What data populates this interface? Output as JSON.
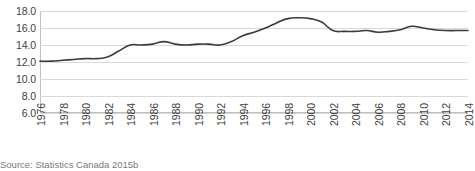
{
  "caption": "Source: Statistics Canada 2015b",
  "colors": {
    "series_line": "#3b3b3b",
    "gridline": "#d9d9d9",
    "axis": "#bfbfbf",
    "text": "#404040",
    "caption_text": "#7a7a7a",
    "background": "#ffffff"
  },
  "chart_data": {
    "type": "line",
    "title": "",
    "subtitle": "",
    "xlabel": "",
    "ylabel": "",
    "grid": true,
    "legend": false,
    "legend_position": "none",
    "xlim": [
      1976,
      2014
    ],
    "ylim": [
      6.0,
      18.0
    ],
    "ytick_labels": [
      "18.0",
      "16.0",
      "14.0",
      "12.0",
      "10.0",
      "8.0",
      "6.0"
    ],
    "yticks": [
      18.0,
      16.0,
      14.0,
      12.0,
      10.0,
      8.0,
      6.0
    ],
    "xtick_labels": [
      "1976",
      "1978",
      "1980",
      "1982",
      "1984",
      "1986",
      "1988",
      "1990",
      "1992",
      "1994",
      "1996",
      "1998",
      "2000",
      "2002",
      "2004",
      "2006",
      "2008",
      "2010",
      "2012",
      "2014"
    ],
    "xticks": [
      1976,
      1978,
      1980,
      1982,
      1984,
      1986,
      1988,
      1990,
      1992,
      1994,
      1996,
      1998,
      2000,
      2002,
      2004,
      2006,
      2008,
      2010,
      2012,
      2014
    ],
    "x": [
      1976,
      1977,
      1978,
      1979,
      1980,
      1981,
      1982,
      1983,
      1984,
      1985,
      1986,
      1987,
      1988,
      1989,
      1990,
      1991,
      1992,
      1993,
      1994,
      1995,
      1996,
      1997,
      1998,
      1999,
      2000,
      2001,
      2002,
      2003,
      2004,
      2005,
      2006,
      2007,
      2008,
      2009,
      2010,
      2011,
      2012,
      2013,
      2014
    ],
    "values": [
      12.1,
      12.1,
      12.2,
      12.3,
      12.4,
      12.4,
      12.6,
      13.3,
      14.0,
      14.0,
      14.1,
      14.4,
      14.1,
      14.0,
      14.1,
      14.1,
      14.0,
      14.4,
      15.1,
      15.5,
      16.0,
      16.6,
      17.1,
      17.2,
      17.1,
      16.7,
      15.7,
      15.6,
      15.6,
      15.7,
      15.5,
      15.6,
      15.8,
      16.2,
      16.0,
      15.8,
      15.7,
      15.7,
      15.7
    ],
    "series": [
      {
        "name": "",
        "values": [
          12.1,
          12.1,
          12.2,
          12.3,
          12.4,
          12.4,
          12.6,
          13.3,
          14.0,
          14.0,
          14.1,
          14.4,
          14.1,
          14.0,
          14.1,
          14.1,
          14.0,
          14.4,
          15.1,
          15.5,
          16.0,
          16.6,
          17.1,
          17.2,
          17.1,
          16.7,
          15.7,
          15.6,
          15.6,
          15.7,
          15.5,
          15.6,
          15.8,
          16.2,
          16.0,
          15.8,
          15.7,
          15.7,
          15.7
        ]
      }
    ]
  }
}
